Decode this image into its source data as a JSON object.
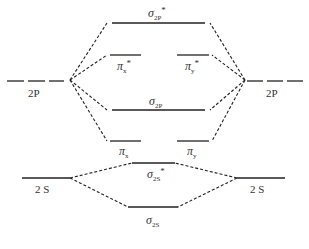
{
  "diagram": {
    "type": "molecular-orbital-energy-diagram",
    "atomic_orbitals": {
      "left_2p": "2P",
      "right_2p": "2P",
      "left_2s": "2 S",
      "right_2s": "2 S"
    },
    "molecular_orbitals": {
      "sigma_2p_star": {
        "symbol": "σ",
        "sub": "2P",
        "sup": "*"
      },
      "pi_x_star": {
        "symbol": "π",
        "sub": "x",
        "sup": "*"
      },
      "pi_y_star": {
        "symbol": "π",
        "sub": "y",
        "sup": "*"
      },
      "sigma_2p": {
        "symbol": "σ",
        "sub": "2P",
        "sup": ""
      },
      "pi_x": {
        "symbol": "π",
        "sub": "x",
        "sup": ""
      },
      "pi_y": {
        "symbol": "π",
        "sub": "y",
        "sup": ""
      },
      "sigma_2s_star": {
        "symbol": "σ",
        "sub": "2S",
        "sup": "*"
      },
      "sigma_2s": {
        "symbol": "σ",
        "sub": "2S",
        "sup": ""
      }
    },
    "colors": {
      "line": "#222222",
      "text": "#333333"
    }
  }
}
